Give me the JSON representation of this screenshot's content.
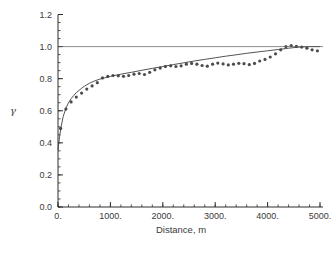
{
  "chart_data": {
    "type": "scatter",
    "title": "",
    "xlabel": "Distance, m",
    "ylabel": "γ",
    "xlim": [
      0,
      5000
    ],
    "ylim": [
      0.0,
      1.2
    ],
    "grid": false,
    "legend": "none",
    "x_ticks": [
      {
        "value": 0,
        "label": "0."
      },
      {
        "value": 1000,
        "label": "1000."
      },
      {
        "value": 2000,
        "label": "2000."
      },
      {
        "value": 3000,
        "label": "3000."
      },
      {
        "value": 4000,
        "label": "4000."
      },
      {
        "value": 5000,
        "label": "5000."
      }
    ],
    "y_ticks": [
      {
        "value": 0.0,
        "label": "0.0"
      },
      {
        "value": 0.2,
        "label": "0.2"
      },
      {
        "value": 0.4,
        "label": "0.4"
      },
      {
        "value": 0.6,
        "label": "0.6"
      },
      {
        "value": 0.8,
        "label": "0.8"
      },
      {
        "value": 1.0,
        "label": "1.0"
      },
      {
        "value": 1.2,
        "label": "1.2"
      }
    ],
    "x_minor_step": 200,
    "y_minor_step": 0.05,
    "colors": {
      "points": "#4c4c4c",
      "model_line": "#3f3f3f",
      "sill_line": "#5a5a5a",
      "axis": "#2f2f2f"
    },
    "series": [
      {
        "name": "experimental-variogram-points",
        "type": "scatter",
        "x": [
          50,
          150,
          250,
          350,
          450,
          550,
          650,
          750,
          850,
          950,
          1050,
          1150,
          1250,
          1350,
          1450,
          1550,
          1650,
          1750,
          1850,
          1950,
          2050,
          2150,
          2250,
          2350,
          2450,
          2550,
          2650,
          2750,
          2850,
          2950,
          3050,
          3150,
          3250,
          3350,
          3450,
          3550,
          3650,
          3750,
          3850,
          3950,
          4050,
          4150,
          4250,
          4350,
          4450,
          4550,
          4650,
          4750,
          4850,
          4950
        ],
        "y": [
          0.49,
          0.61,
          0.655,
          0.685,
          0.71,
          0.735,
          0.755,
          0.775,
          0.805,
          0.815,
          0.82,
          0.818,
          0.815,
          0.82,
          0.828,
          0.832,
          0.826,
          0.84,
          0.855,
          0.866,
          0.875,
          0.88,
          0.876,
          0.88,
          0.89,
          0.895,
          0.89,
          0.882,
          0.878,
          0.89,
          0.897,
          0.892,
          0.886,
          0.89,
          0.896,
          0.893,
          0.888,
          0.895,
          0.91,
          0.92,
          0.935,
          0.955,
          0.98,
          1.0,
          1.007,
          1.002,
          0.997,
          0.99,
          0.98,
          0.974
        ]
      },
      {
        "name": "variogram-model-curve",
        "type": "line",
        "x": [
          0,
          30,
          60,
          100,
          150,
          200,
          250,
          300,
          350,
          400,
          450,
          500,
          550,
          600,
          650,
          700,
          800,
          900,
          1000,
          1200,
          1400,
          1600,
          1800,
          2000,
          2200,
          2400,
          2600,
          2800,
          3000,
          3200,
          3400,
          3600,
          3800,
          4000,
          4200,
          4400,
          4600,
          4800,
          5000
        ],
        "y": [
          0.355,
          0.44,
          0.5,
          0.565,
          0.615,
          0.65,
          0.675,
          0.695,
          0.713,
          0.727,
          0.74,
          0.752,
          0.762,
          0.771,
          0.779,
          0.786,
          0.797,
          0.806,
          0.814,
          0.828,
          0.84,
          0.852,
          0.864,
          0.876,
          0.888,
          0.899,
          0.91,
          0.92,
          0.93,
          0.94,
          0.949,
          0.958,
          0.966,
          0.974,
          0.982,
          0.99,
          0.997,
          1.0,
          1.0
        ]
      },
      {
        "name": "sill-line",
        "type": "line",
        "x": [
          0,
          5000
        ],
        "y": [
          1.0,
          1.0
        ]
      }
    ]
  }
}
